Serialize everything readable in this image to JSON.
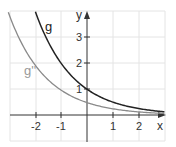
{
  "chart_data": {
    "type": "line",
    "title": "",
    "xlabel": "x",
    "ylabel": "y",
    "xlim": [
      -3.0,
      3.0
    ],
    "ylim": [
      -1.0,
      4.0
    ],
    "grid": true,
    "x_ticks": [
      "-2",
      "-1",
      "1",
      "2"
    ],
    "y_ticks": [
      "1",
      "2",
      "3"
    ],
    "series": [
      {
        "name": "g",
        "color": "#222222",
        "formula": "2^(-x)",
        "x": [
          -2,
          -1,
          0,
          1,
          2,
          3
        ],
        "values": [
          4,
          2,
          1,
          0.5,
          0.25,
          0.125
        ]
      },
      {
        "name": "g''",
        "color": "#8a8a8a",
        "formula": "(ln 2)^2 * 2^(-x)",
        "x": [
          -3,
          -2,
          -1,
          0,
          1,
          2,
          3
        ],
        "values": [
          3.84,
          1.92,
          0.96,
          0.48,
          0.24,
          0.12,
          0.06
        ]
      }
    ]
  },
  "labels": {
    "x_axis": "x",
    "y_axis": "y",
    "g": "g",
    "gpp": "g''",
    "xt": [
      "-2",
      "-1",
      "1",
      "2"
    ],
    "yt": [
      "1",
      "2",
      "3"
    ]
  }
}
